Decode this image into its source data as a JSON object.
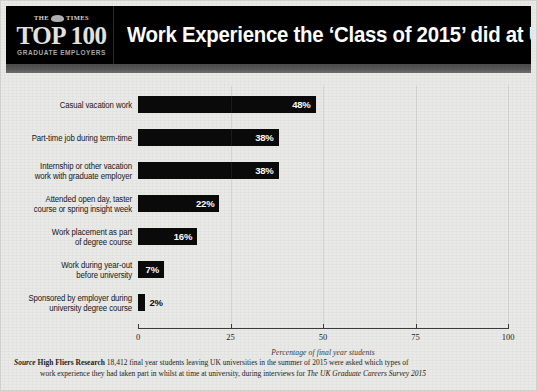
{
  "header": {
    "masthead": "THE TIMES",
    "masthead_left": "THE",
    "masthead_right": "TIMES",
    "logo_main": "TOP 100",
    "logo_sub": "GRADUATE EMPLOYERS",
    "title": "Work Experience the ‘Class of 2015’ did at University",
    "background_color": "#000000",
    "title_color": "#ffffff"
  },
  "chart_data": {
    "type": "bar",
    "orientation": "horizontal",
    "title": "Work Experience the ‘Class of 2015’ did at University",
    "subtitle": "",
    "xlabel": "Percentage of final year students",
    "ylabel": "",
    "xlim": [
      0,
      100
    ],
    "xticks": [
      0,
      25,
      50,
      75,
      100
    ],
    "xtick_labels": [
      "0",
      "25",
      "50",
      "75",
      "100"
    ],
    "grid": false,
    "legend": false,
    "bar_color": "#0a0a0a",
    "value_label_color": "#ffffff",
    "categories": [
      "Casual vacation work",
      "Part-time job during term-time",
      "Internship or other vacation work with graduate employer",
      "Attended open day, taster course or spring insight week",
      "Work placement as part of degree course",
      "Work during year-out before university",
      "Sponsored by employer during university degree course"
    ],
    "values": [
      48,
      38,
      38,
      22,
      16,
      7,
      2
    ],
    "value_labels": [
      "48%",
      "38%",
      "38%",
      "22%",
      "16%",
      "7%",
      "2%"
    ]
  },
  "bars": [
    {
      "label_line1": "Casual vacation work",
      "label_line2": "",
      "value": 48,
      "value_label": "48%",
      "label_inside": true
    },
    {
      "label_line1": "Part-time job during term-time",
      "label_line2": "",
      "value": 38,
      "value_label": "38%",
      "label_inside": true
    },
    {
      "label_line1": "Internship or other vacation",
      "label_line2": "work with graduate employer",
      "value": 38,
      "value_label": "38%",
      "label_inside": true
    },
    {
      "label_line1": "Attended open day, taster",
      "label_line2": "course or spring insight week",
      "value": 22,
      "value_label": "22%",
      "label_inside": true
    },
    {
      "label_line1": "Work placement as part",
      "label_line2": "of degree course",
      "value": 16,
      "value_label": "16%",
      "label_inside": true
    },
    {
      "label_line1": "Work during year-out",
      "label_line2": "before university",
      "value": 7,
      "value_label": "7%",
      "label_inside": true
    },
    {
      "label_line1": "Sponsored by employer during",
      "label_line2": "university degree course",
      "value": 2,
      "value_label": "2%",
      "label_inside": false
    }
  ],
  "axis": {
    "caption": "Percentage of final year students",
    "ticks": [
      "0",
      "25",
      "50",
      "75",
      "100"
    ]
  },
  "footer": {
    "source_word": "Source",
    "organisation": "High Fliers Research",
    "body_part1": "18,412 final year students leaving UK universities in the summer of 2015 were asked which types of",
    "body_part2": "work experience they had taken part in whilst at time at university, during interviews for ",
    "publication": "The UK Graduate Careers Survey 2015"
  }
}
